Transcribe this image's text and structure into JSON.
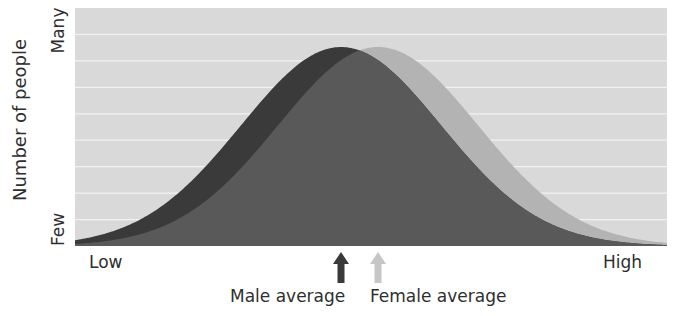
{
  "chart_data": {
    "type": "area",
    "title": "",
    "xlabel": "",
    "ylabel": "Number of people",
    "x_tick_labels": {
      "left": "Low",
      "right": "High"
    },
    "y_tick_labels": {
      "bottom": "Few",
      "top": "Many"
    },
    "grid": true,
    "grid_lines": 8,
    "series": [
      {
        "name": "Male",
        "distribution": "normal",
        "mean_px": 341,
        "sigma_px": 100,
        "peak": 1.0,
        "color": "#3a3a3a"
      },
      {
        "name": "Female",
        "distribution": "normal",
        "mean_px": 378,
        "sigma_px": 100,
        "peak": 1.0,
        "color": "#b3b3b3"
      }
    ],
    "overlap_color": "#595959",
    "annotations": [
      {
        "label": "Male average",
        "arrow_x_px": 341,
        "arrow_color": "#3a3a3a"
      },
      {
        "label": "Female average",
        "arrow_x_px": 378,
        "arrow_color": "#c6c6c6"
      }
    ],
    "plot_area_px": {
      "left": 75,
      "top": 8,
      "right": 667,
      "bottom": 246,
      "peak_top": 47
    },
    "colors": {
      "background": "#d9d9d9",
      "grid": "#f2f2f2"
    }
  },
  "labels": {
    "ylabel": "Number of people",
    "y_top": "Many",
    "y_bottom": "Few",
    "x_left": "Low",
    "x_right": "High",
    "male_average": "Male average",
    "female_average": "Female average"
  }
}
